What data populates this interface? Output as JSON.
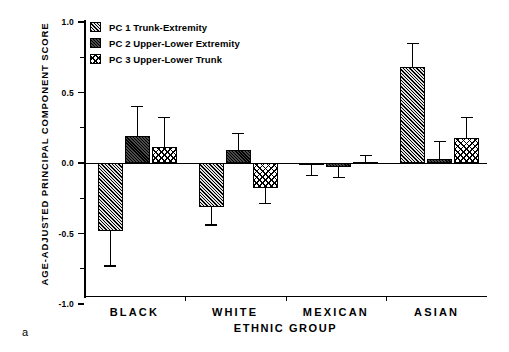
{
  "panel_label": "a",
  "chart_data": {
    "type": "bar",
    "title": "",
    "xlabel": "ETHNIC GROUP",
    "ylabel": "AGE-ADJUSTED PRINCIPAL COMPONENT SCORE",
    "categories": [
      "BLACK",
      "WHITE",
      "MEXICAN",
      "ASIAN"
    ],
    "ylim": [
      -1.0,
      1.0
    ],
    "yticks": [
      1.0,
      0.5,
      0.0,
      -0.5,
      -1.0
    ],
    "ytick_labels": [
      "1.0",
      "0.5",
      "0.0",
      "-0.5",
      "-1.0"
    ],
    "yminor_ticks": [
      0.75,
      0.25,
      -0.25,
      -0.75
    ],
    "grid": false,
    "legend_position": "top-left",
    "orientation": "vertical",
    "error_bars": "one-sided",
    "series": [
      {
        "name": "PC 1 Trunk-Extremity",
        "key": "pc1",
        "pattern": "diagonal-hatch",
        "values": [
          -0.48,
          -0.31,
          -0.01,
          0.68
        ],
        "errors": [
          0.25,
          0.13,
          0.08,
          0.17
        ]
      },
      {
        "name": "PC 2 Upper-Lower Extremity",
        "key": "pc2",
        "pattern": "solid-dark",
        "values": [
          0.19,
          0.09,
          -0.03,
          0.03
        ],
        "errors": [
          0.21,
          0.12,
          0.07,
          0.12
        ]
      },
      {
        "name": "PC 3 Upper-Lower Trunk",
        "key": "pc3",
        "pattern": "cross-hatch",
        "values": [
          0.11,
          -0.18,
          0.005,
          0.18
        ],
        "errors": [
          0.21,
          0.11,
          0.05,
          0.14
        ]
      }
    ]
  },
  "legend": {
    "items": [
      {
        "label": "PC 1 Trunk-Extremity",
        "pattern": "diagonal-hatch"
      },
      {
        "label": "PC 2 Upper-Lower Extremity",
        "pattern": "solid-dark"
      },
      {
        "label": "PC 3 Upper-Lower Trunk",
        "pattern": "cross-hatch"
      }
    ]
  }
}
